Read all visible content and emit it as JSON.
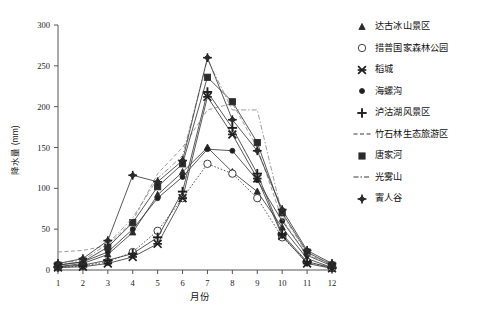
{
  "chart_data": {
    "type": "line",
    "title": "",
    "xlabel": "月份",
    "ylabel": "降水量 (mm)",
    "xlim": [
      1,
      12
    ],
    "ylim": [
      0,
      300
    ],
    "ytick_labels": [
      "0",
      "50",
      "100",
      "150",
      "200",
      "250",
      "300"
    ],
    "yticks": [
      0,
      50,
      100,
      150,
      200,
      250,
      300
    ],
    "xtick_labels": [
      "1",
      "2",
      "3",
      "4",
      "5",
      "6",
      "7",
      "8",
      "9",
      "10",
      "11",
      "12"
    ],
    "xticks": [
      1,
      2,
      3,
      4,
      5,
      6,
      7,
      8,
      9,
      10,
      11,
      12
    ],
    "categories": [
      1,
      2,
      3,
      4,
      5,
      6,
      7,
      8,
      9,
      10,
      11,
      12
    ],
    "grid": false,
    "legend_position": "right",
    "series": [
      {
        "name": "达古冰山景区",
        "marker": "triangle",
        "linestyle": "solid",
        "values": [
          4,
          8,
          19,
          46,
          92,
          120,
          150,
          120,
          96,
          52,
          14,
          3
        ]
      },
      {
        "name": "措普国家森林公园",
        "marker": "circle-open",
        "linestyle": "dotted",
        "values": [
          3,
          5,
          10,
          22,
          48,
          88,
          130,
          118,
          88,
          40,
          10,
          2
        ]
      },
      {
        "name": "稻城",
        "marker": "star",
        "linestyle": "solid",
        "values": [
          3,
          4,
          8,
          16,
          32,
          88,
          212,
          166,
          112,
          42,
          8,
          2
        ]
      },
      {
        "name": "海螺沟",
        "marker": "dot",
        "linestyle": "solid",
        "values": [
          6,
          10,
          22,
          50,
          88,
          114,
          148,
          146,
          110,
          60,
          18,
          5
        ]
      },
      {
        "name": "泸沽湖风景区",
        "marker": "plus",
        "linestyle": "solid",
        "values": [
          4,
          6,
          12,
          20,
          40,
          96,
          218,
          174,
          118,
          44,
          10,
          3
        ]
      },
      {
        "name": "竹石林生态旅游区",
        "marker": "none",
        "linestyle": "dashed",
        "values": [
          22,
          24,
          30,
          60,
          118,
          150,
          196,
          204,
          150,
          62,
          18,
          8
        ]
      },
      {
        "name": "唐家河",
        "marker": "square",
        "linestyle": "solid",
        "values": [
          6,
          10,
          28,
          58,
          102,
          130,
          236,
          206,
          156,
          70,
          22,
          6
        ]
      },
      {
        "name": "光雾山",
        "marker": "none",
        "linestyle": "dashdot",
        "values": [
          8,
          12,
          32,
          64,
          112,
          140,
          258,
          196,
          196,
          68,
          20,
          7
        ]
      },
      {
        "name": "賨人谷",
        "marker": "diamond",
        "linestyle": "solid",
        "values": [
          8,
          14,
          36,
          116,
          108,
          134,
          260,
          184,
          146,
          74,
          24,
          8
        ]
      }
    ]
  },
  "legend": {
    "items": [
      {
        "label": "达古冰山景区",
        "glyph": "triangle-marker-icon"
      },
      {
        "label": "措普国家森林公园",
        "glyph": "circle-open-marker-icon"
      },
      {
        "label": "稻城",
        "glyph": "star-marker-icon"
      },
      {
        "label": "海螺沟",
        "glyph": "dot-marker-icon"
      },
      {
        "label": "泸沽湖风景区",
        "glyph": "plus-marker-icon"
      },
      {
        "label": "竹石林生态旅游区",
        "glyph": "dashed-line-icon"
      },
      {
        "label": "唐家河",
        "glyph": "square-marker-icon"
      },
      {
        "label": "光雾山",
        "glyph": "solid-line-icon"
      },
      {
        "label": "賨人谷",
        "glyph": "diamond-marker-icon"
      }
    ]
  },
  "axes": {
    "y_title": "降水量 (mm)",
    "x_title": "月份"
  }
}
